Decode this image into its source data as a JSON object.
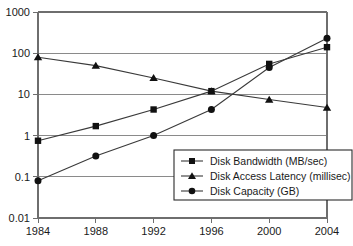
{
  "chart_data": {
    "type": "line",
    "title": "",
    "subtitle": "",
    "xlabel": "",
    "ylabel": "",
    "yscale": "log",
    "ylim": [
      0.01,
      1000
    ],
    "grid": true,
    "legend_position": "bottom-right",
    "categories": [
      "1984",
      "1988",
      "1992",
      "1996",
      "2000",
      "2004"
    ],
    "x": [
      1984,
      1988,
      1992,
      1996,
      2000,
      2004
    ],
    "y_ticks": [
      "1000",
      "100",
      "10",
      "1",
      "0.1",
      "0.01"
    ],
    "y_tick_values": [
      1000,
      100,
      10,
      1,
      0.1,
      0.01
    ],
    "x_ticks": [
      "1984",
      "1988",
      "1992",
      "1996",
      "2000",
      "2004"
    ],
    "series": [
      {
        "name": "Disk Bandwidth (MB/sec)",
        "marker": "square",
        "color": "#111111",
        "values": [
          0.75,
          1.7,
          4.3,
          12,
          55,
          140
        ]
      },
      {
        "name": "Disk Access Latency (millisec)",
        "marker": "triangle",
        "color": "#111111",
        "values": [
          80,
          50,
          25,
          12,
          7.5,
          4.8
        ]
      },
      {
        "name": "Disk Capacity (GB)",
        "marker": "circle",
        "color": "#111111",
        "values": [
          0.08,
          0.32,
          1.0,
          4.3,
          45,
          230
        ]
      }
    ]
  },
  "legend": {
    "entries": [
      {
        "label": "Disk Bandwidth (MB/sec)",
        "marker": "square"
      },
      {
        "label": "Disk Access Latency (millisec)",
        "marker": "triangle"
      },
      {
        "label": "Disk Capacity (GB)",
        "marker": "circle"
      }
    ]
  },
  "colors": {
    "axis": "#6e6e6e",
    "grid": "#8a8a8a",
    "series": "#3a3a3a",
    "marker": "#111111",
    "text": "#1a1a1a",
    "background": "#ffffff"
  }
}
